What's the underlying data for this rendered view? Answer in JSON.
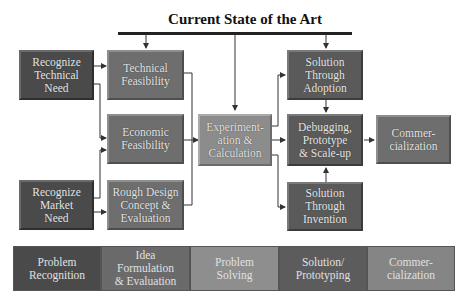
{
  "title": "Current State of the Art",
  "boxes": {
    "recognize_technical": "Recognize\nTechnical\nNeed",
    "recognize_market": "Recognize\nMarket\nNeed",
    "technical_feasibility": "Technical\nFeasibility",
    "economic_feasibility": "Economic\nFeasibility",
    "rough_design": "Rough Design\nConcept &\nEvaluation",
    "experimentation": "Experiment-\nation &\nCalculation",
    "solution_adoption": "Solution\nThrough\nAdoption",
    "debugging": "Debugging,\nPrototype\n& Scale-up",
    "solution_invention": "Solution\nThrough\nInvention",
    "commercialization": "Commer-\ncialization"
  },
  "phases": [
    "Problem\nRecognition",
    "Idea\nFormulation\n& Evaluation",
    "Problem\nSolving",
    "Solution/\nPrototyping",
    "Commer-\ncialization"
  ],
  "colors": {
    "dark": "#4a4a4a",
    "mid": "#6e6e6e",
    "light": "#8c8c8c",
    "line": "#333333"
  }
}
